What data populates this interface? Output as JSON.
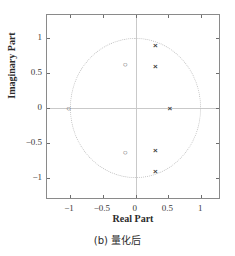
{
  "figure": {
    "caption_prefix": "(b)",
    "caption_text": "量化后",
    "caption_full": "(b) 量化后"
  },
  "chart_data": {
    "type": "scatter",
    "title": "",
    "subtitle": "",
    "xlabel": "Real Part",
    "ylabel": "Imaginary Part",
    "xlim": [
      -1.35,
      1.3
    ],
    "ylim": [
      -1.32,
      1.33
    ],
    "xticks": [
      -1,
      -0.5,
      0,
      0.5,
      1
    ],
    "xticklabels": [
      "−1",
      "−0.5",
      "0",
      "0.5",
      "1"
    ],
    "yticks": [
      1,
      0.5,
      0,
      -0.5,
      -1
    ],
    "yticklabels": [
      "1",
      "0.5",
      "0",
      "−0.5",
      "−1"
    ],
    "grid": false,
    "legend": "none",
    "annotations": [
      "unit circle (dotted)"
    ],
    "reference_shapes": [
      {
        "name": "unit-circle",
        "kind": "circle",
        "cx": 0,
        "cy": 0,
        "r": 1,
        "style": "dotted",
        "color": "#c2c2c2"
      },
      {
        "name": "real-axis",
        "kind": "hline",
        "y": 0,
        "color": "#c9c9c9"
      },
      {
        "name": "imaginary-axis",
        "kind": "vline",
        "x": 0,
        "color": "#c9c9c9"
      }
    ],
    "series": [
      {
        "name": "Zeros",
        "marker": "o",
        "marker_glyph": "○",
        "color": "#555555",
        "points": [
          {
            "x": -1.02,
            "y": 0.0
          },
          {
            "x": -0.16,
            "y": 0.63
          },
          {
            "x": -0.16,
            "y": -0.63
          }
        ]
      },
      {
        "name": "Poles",
        "marker": "x",
        "marker_glyph": "×",
        "color": "#3d3d3d",
        "points": [
          {
            "x": 0.52,
            "y": 0.0
          },
          {
            "x": 0.3,
            "y": 0.9
          },
          {
            "x": 0.3,
            "y": 0.6
          },
          {
            "x": 0.3,
            "y": -0.6
          },
          {
            "x": 0.3,
            "y": -0.9
          }
        ]
      }
    ]
  }
}
